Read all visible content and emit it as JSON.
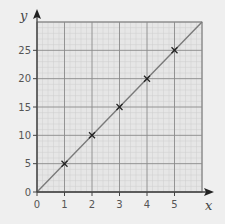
{
  "chart_data": {
    "type": "line",
    "title": "",
    "xlabel": "x",
    "ylabel": "y",
    "xlim": [
      0,
      6
    ],
    "ylim": [
      0,
      30
    ],
    "grid": true,
    "x_ticks": [
      0,
      1,
      2,
      3,
      4,
      5
    ],
    "y_ticks": [
      0,
      5,
      10,
      15,
      20,
      25
    ],
    "x_tick_labels": [
      "0",
      "1",
      "2",
      "3",
      "4",
      "5"
    ],
    "y_tick_labels": [
      "0",
      "5",
      "10",
      "15",
      "20",
      "25"
    ],
    "series": [
      {
        "name": "line",
        "style": "line",
        "x": [
          0,
          6
        ],
        "y": [
          0,
          30
        ]
      },
      {
        "name": "points",
        "style": "cross-markers",
        "x": [
          1,
          2,
          3,
          4,
          5
        ],
        "y": [
          5,
          10,
          15,
          20,
          25
        ]
      }
    ],
    "colors": {
      "background": "#efefef",
      "grid_area": "#e6e6e6",
      "minor_grid": "#cfcfcf",
      "major_grid": "#8a8a8a",
      "axis": "#444444",
      "line": "#7a7a7a",
      "marker": "#222222"
    }
  }
}
